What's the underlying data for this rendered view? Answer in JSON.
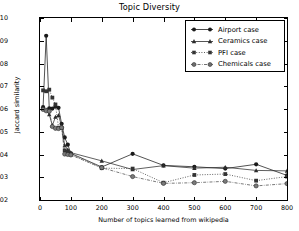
{
  "chart_data": {
    "type": "line",
    "title": "Topic Diversity",
    "xlabel": "Number of topics learned from wikipedia",
    "ylabel": "Jaccard similarity",
    "xlim": [
      0,
      800
    ],
    "ylim": [
      0.002,
      0.01
    ],
    "xticks": [
      0,
      100,
      200,
      300,
      400,
      500,
      600,
      700,
      800
    ],
    "yticks": [
      0.002,
      0.003,
      0.004,
      0.005,
      0.006,
      0.007,
      0.008,
      0.009,
      0.01
    ],
    "xtick_labels": [
      "0",
      "100",
      "200",
      "300",
      "400",
      "500",
      "600",
      "700",
      "800"
    ],
    "ytick_labels": [
      "0.002",
      "0.003",
      "0.004",
      "0.005",
      "0.006",
      "0.007",
      "0.008",
      "0.009",
      "0.010"
    ],
    "grid": false,
    "legend_position": "upper right",
    "x": [
      10,
      20,
      30,
      40,
      50,
      60,
      70,
      80,
      90,
      100,
      200,
      300,
      400,
      500,
      600,
      700,
      800
    ],
    "series": [
      {
        "name": "Airport case",
        "marker": "circle",
        "linestyle": "solid",
        "color": "#1a1a1a",
        "values": [
          0.00608,
          0.00922,
          0.00603,
          0.00602,
          0.0061,
          0.00605,
          0.00535,
          0.00475,
          0.00443,
          0.00405,
          0.00345,
          0.00403,
          0.00352,
          0.00346,
          0.00338,
          0.00357,
          0.00308
        ]
      },
      {
        "name": "Ceramics case",
        "marker": "triangle",
        "linestyle": "solid",
        "color": "#2b2b2b",
        "values": [
          0.00601,
          0.00597,
          0.00576,
          0.00528,
          0.00565,
          0.00572,
          0.00525,
          0.0044,
          0.00421,
          0.00408,
          0.00372,
          0.00334,
          0.00351,
          0.0034,
          0.00344,
          0.0033,
          0.00328
        ]
      },
      {
        "name": "PFI case",
        "marker": "square",
        "linestyle": "dotted",
        "color": "#333333",
        "values": [
          0.00682,
          0.00678,
          0.00685,
          0.0065,
          0.0062,
          0.00518,
          0.00516,
          0.00418,
          0.00412,
          0.004,
          0.0034,
          0.00338,
          0.00276,
          0.0031,
          0.00314,
          0.00285,
          0.00303
        ]
      },
      {
        "name": "Chemicals case",
        "marker": "circle-open",
        "linestyle": "dashdot",
        "color": "#4d4d4d",
        "values": [
          0.00598,
          0.00592,
          0.0059,
          0.00523,
          0.00515,
          0.00514,
          0.00518,
          0.00402,
          0.004,
          0.00398,
          0.00342,
          0.00303,
          0.00273,
          0.00276,
          0.00282,
          0.00262,
          0.00272
        ]
      }
    ]
  },
  "legend": {
    "items": [
      {
        "label": "Airport case"
      },
      {
        "label": "Ceramics case"
      },
      {
        "label": "PFI case"
      },
      {
        "label": "Chemicals case"
      }
    ]
  }
}
